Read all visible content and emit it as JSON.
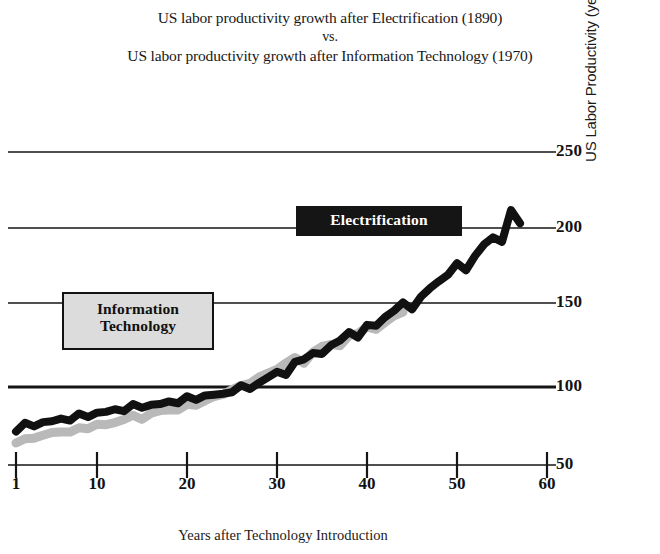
{
  "title": {
    "line1": "US labor productivity growth after Electrification (1890)",
    "line2": "vs.",
    "line3": "US labor productivity growth after Information Technology (1970)"
  },
  "axes": {
    "xlabel": "Years after Technology Introduction",
    "ylabel": "US Labor Productivity (year 26 = 100)"
  },
  "callouts": {
    "electrification": "Electrification",
    "information_technology_line1": "Information",
    "information_technology_line2": "Technology"
  },
  "chart_data": {
    "type": "line",
    "title": "US labor productivity growth after Electrification (1890) vs. US labor productivity growth after Information Technology (1970)",
    "xlabel": "Years after Technology Introduction",
    "ylabel": "US Labor Productivity (year 26 = 100)",
    "xlim": [
      1,
      60
    ],
    "ylim": [
      50,
      250
    ],
    "xticks": [
      1,
      10,
      20,
      30,
      40,
      50,
      60
    ],
    "yticks": [
      50,
      100,
      150,
      200,
      250
    ],
    "grid": "horizontal",
    "legend": "inline-callouts",
    "series": [
      {
        "name": "Electrification",
        "color": "#111111",
        "style": "thick-black-wavy",
        "x": [
          1,
          2,
          3,
          4,
          5,
          6,
          7,
          8,
          9,
          10,
          11,
          12,
          13,
          14,
          15,
          16,
          17,
          18,
          19,
          20,
          21,
          22,
          23,
          24,
          25,
          26,
          27,
          28,
          29,
          30,
          31,
          32,
          33,
          34,
          35,
          36,
          37,
          38,
          39,
          40,
          41,
          42,
          43,
          44,
          45,
          46,
          47,
          48,
          49,
          50,
          51,
          52,
          53,
          54,
          55,
          56,
          57
        ],
        "values": [
          72,
          76,
          75,
          78,
          77,
          80,
          79,
          82,
          81,
          84,
          83,
          86,
          85,
          88,
          87,
          89,
          88,
          91,
          90,
          93,
          92,
          95,
          94,
          96,
          97,
          100,
          99,
          103,
          105,
          110,
          108,
          115,
          118,
          122,
          120,
          127,
          130,
          134,
          132,
          140,
          138,
          145,
          149,
          153,
          150,
          158,
          162,
          168,
          172,
          178,
          175,
          184,
          190,
          196,
          193,
          212,
          205
        ]
      },
      {
        "name": "Information Technology",
        "color": "#b9b9b9",
        "style": "thick-gray-wavy",
        "x": [
          1,
          2,
          3,
          4,
          5,
          6,
          7,
          8,
          9,
          10,
          11,
          12,
          13,
          14,
          15,
          16,
          17,
          18,
          19,
          20,
          21,
          22,
          23,
          24,
          25,
          26,
          27,
          28,
          29,
          30,
          31,
          32,
          33,
          34,
          35,
          36,
          37,
          38,
          39,
          40,
          41,
          42,
          43,
          44
        ],
        "values": [
          64,
          66,
          68,
          69,
          70,
          72,
          71,
          73,
          74,
          76,
          75,
          78,
          79,
          81,
          80,
          83,
          84,
          86,
          85,
          88,
          89,
          91,
          93,
          96,
          98,
          100,
          103,
          106,
          108,
          112,
          115,
          118,
          116,
          122,
          125,
          128,
          126,
          132,
          135,
          138,
          136,
          142,
          145,
          147
        ]
      }
    ]
  }
}
